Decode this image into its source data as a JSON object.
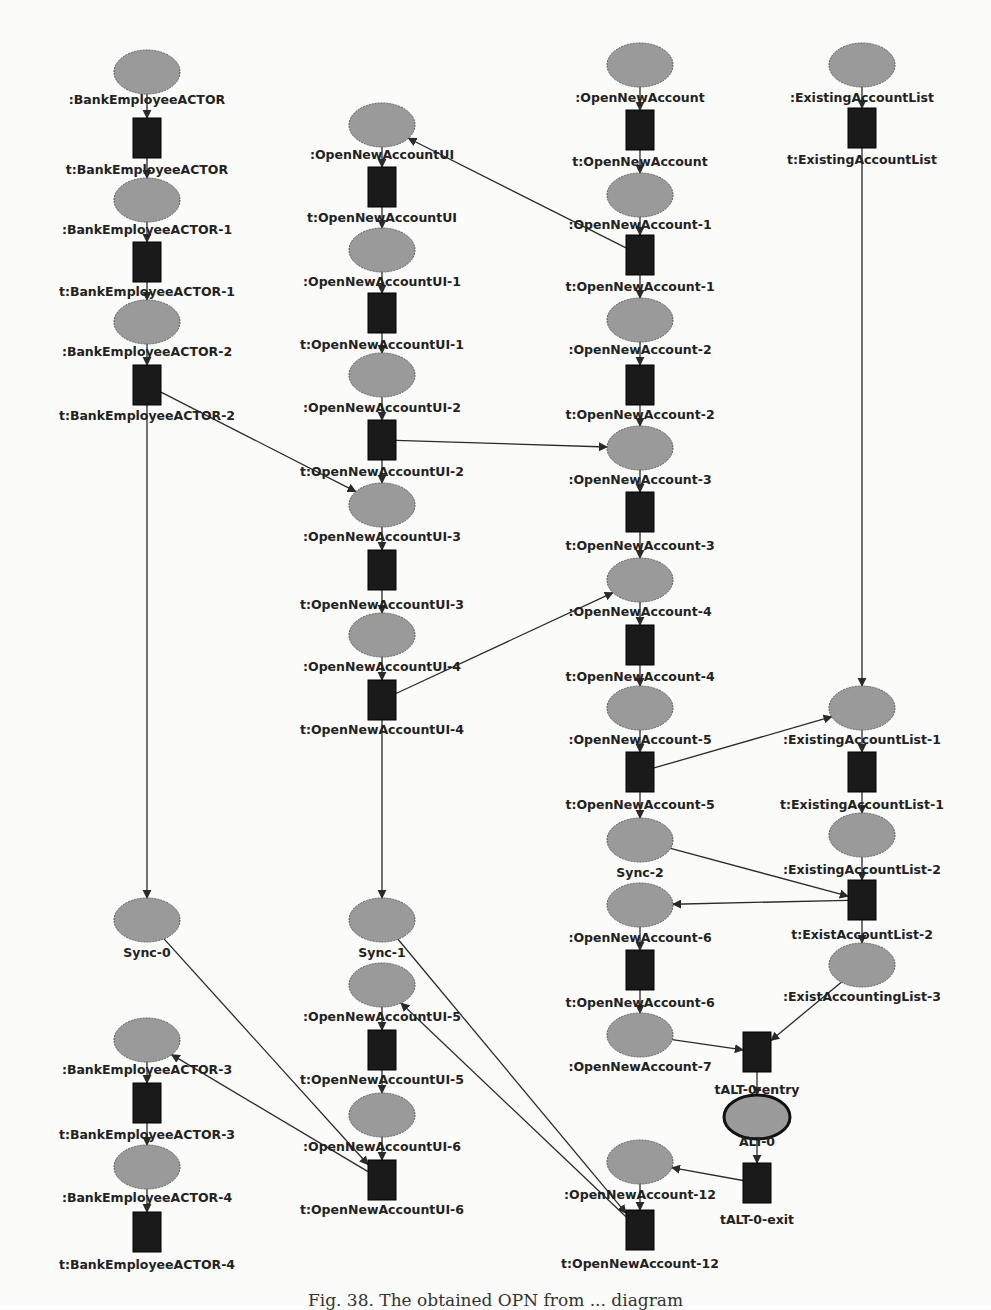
{
  "diagram": {
    "type": "petri-net",
    "colors": {
      "place_fill": "#9a9a9a",
      "place_stroke": "#555555",
      "transition_fill": "#1a1a1a",
      "arc": "#2a2a2a",
      "label": "#222222",
      "background": "#fbfbfa"
    },
    "places": [
      {
        "id": "p_bea",
        "label": ":BankEmployeeACTOR"
      },
      {
        "id": "p_bea1",
        "label": ":BankEmployeeACTOR-1"
      },
      {
        "id": "p_bea2",
        "label": ":BankEmployeeACTOR-2"
      },
      {
        "id": "p_sync0",
        "label": "Sync-0"
      },
      {
        "id": "p_bea3",
        "label": ":BankEmployeeACTOR-3"
      },
      {
        "id": "p_bea4",
        "label": ":BankEmployeeACTOR-4"
      },
      {
        "id": "p_ui",
        "label": ":OpenNewAccountUI"
      },
      {
        "id": "p_ui1",
        "label": ":OpenNewAccountUI-1"
      },
      {
        "id": "p_ui2",
        "label": ":OpenNewAccountUI-2"
      },
      {
        "id": "p_ui3",
        "label": ":OpenNewAccountUI-3"
      },
      {
        "id": "p_ui4",
        "label": ":OpenNewAccountUI-4"
      },
      {
        "id": "p_sync1",
        "label": "Sync-1"
      },
      {
        "id": "p_ui5",
        "label": ":OpenNewAccountUI-5"
      },
      {
        "id": "p_ui6",
        "label": ":OpenNewAccountUI-6"
      },
      {
        "id": "p_ona",
        "label": ":OpenNewAccount"
      },
      {
        "id": "p_ona1",
        "label": ":OpenNewAccount-1"
      },
      {
        "id": "p_ona2",
        "label": ":OpenNewAccount-2"
      },
      {
        "id": "p_ona3",
        "label": ":OpenNewAccount-3"
      },
      {
        "id": "p_ona4",
        "label": ":OpenNewAccount-4"
      },
      {
        "id": "p_ona5",
        "label": ":OpenNewAccount-5"
      },
      {
        "id": "p_sync2",
        "label": "Sync-2"
      },
      {
        "id": "p_ona6",
        "label": ":OpenNewAccount-6"
      },
      {
        "id": "p_ona7",
        "label": ":OpenNewAccount-7"
      },
      {
        "id": "p_alt0",
        "label": "ALT-0",
        "emphasized": true
      },
      {
        "id": "p_ona12",
        "label": ":OpenNewAccount-12"
      },
      {
        "id": "p_eal",
        "label": ":ExistingAccountList"
      },
      {
        "id": "p_eal1",
        "label": ":ExistingAccountList-1"
      },
      {
        "id": "p_eal2",
        "label": ":ExistingAccountList-2"
      },
      {
        "id": "p_eal3",
        "label": ":ExistAccountingList-3"
      }
    ],
    "transitions": [
      {
        "id": "t_bea",
        "label": "t:BankEmployeeACTOR"
      },
      {
        "id": "t_bea1",
        "label": "t:BankEmployeeACTOR-1"
      },
      {
        "id": "t_bea2",
        "label": "t:BankEmployeeACTOR-2"
      },
      {
        "id": "t_bea3",
        "label": "t:BankEmployeeACTOR-3"
      },
      {
        "id": "t_bea4",
        "label": "t:BankEmployeeACTOR-4"
      },
      {
        "id": "t_ui",
        "label": "t:OpenNewAccountUI"
      },
      {
        "id": "t_ui1",
        "label": "t:OpenNewAccountUI-1"
      },
      {
        "id": "t_ui2",
        "label": "t:OpenNewAccountUI-2"
      },
      {
        "id": "t_ui3",
        "label": "t:OpenNewAccountUI-3"
      },
      {
        "id": "t_ui4",
        "label": "t:OpenNewAccountUI-4"
      },
      {
        "id": "t_ui5",
        "label": "t:OpenNewAccountUI-5"
      },
      {
        "id": "t_ui6",
        "label": "t:OpenNewAccountUI-6"
      },
      {
        "id": "t_ona",
        "label": "t:OpenNewAccount"
      },
      {
        "id": "t_ona1",
        "label": "t:OpenNewAccount-1"
      },
      {
        "id": "t_ona2",
        "label": "t:OpenNewAccount-2"
      },
      {
        "id": "t_ona3",
        "label": "t:OpenNewAccount-3"
      },
      {
        "id": "t_ona4",
        "label": "t:OpenNewAccount-4"
      },
      {
        "id": "t_ona5",
        "label": "t:OpenNewAccount-5"
      },
      {
        "id": "t_ona6",
        "label": "t:OpenNewAccount-6"
      },
      {
        "id": "t_alt_entry",
        "label": "tALT-0-entry"
      },
      {
        "id": "t_alt_exit",
        "label": "tALT-0-exit"
      },
      {
        "id": "t_ona12",
        "label": "t:OpenNewAccount-12"
      },
      {
        "id": "t_eal",
        "label": "t:ExistingAccountList"
      },
      {
        "id": "t_eal1",
        "label": "t:ExistingAccountList-1"
      },
      {
        "id": "t_eal2",
        "label": "t:ExistAccountList-2"
      }
    ],
    "arcs": [
      [
        "p_bea",
        "t_bea"
      ],
      [
        "t_bea",
        "p_bea1"
      ],
      [
        "p_bea1",
        "t_bea1"
      ],
      [
        "t_bea1",
        "p_bea2"
      ],
      [
        "p_bea2",
        "t_bea2"
      ],
      [
        "t_bea2",
        "p_sync0"
      ],
      [
        "t_bea2",
        "p_ui3"
      ],
      [
        "p_sync0",
        "t_ui6"
      ],
      [
        "t_ui6",
        "p_bea3"
      ],
      [
        "p_bea3",
        "t_bea3"
      ],
      [
        "t_bea3",
        "p_bea4"
      ],
      [
        "p_bea4",
        "t_bea4"
      ],
      [
        "p_ui",
        "t_ui"
      ],
      [
        "t_ui",
        "p_ui1"
      ],
      [
        "p_ui1",
        "t_ui1"
      ],
      [
        "t_ui1",
        "p_ui2"
      ],
      [
        "p_ui2",
        "t_ui2"
      ],
      [
        "t_ui2",
        "p_ui3"
      ],
      [
        "t_ui2",
        "p_ona3"
      ],
      [
        "p_ui3",
        "t_ui3"
      ],
      [
        "t_ui3",
        "p_ui4"
      ],
      [
        "p_ui4",
        "t_ui4"
      ],
      [
        "t_ui4",
        "p_sync1"
      ],
      [
        "t_ui4",
        "p_ona4"
      ],
      [
        "p_sync1",
        "t_ona12"
      ],
      [
        "t_ona12",
        "p_ui5"
      ],
      [
        "p_ui5",
        "t_ui5"
      ],
      [
        "t_ui5",
        "p_ui6"
      ],
      [
        "p_ui6",
        "t_ui6"
      ],
      [
        "p_ona",
        "t_ona"
      ],
      [
        "t_ona",
        "p_ona1"
      ],
      [
        "p_ona1",
        "t_ona1"
      ],
      [
        "t_ona1",
        "p_ui"
      ],
      [
        "t_ona1",
        "p_ona2"
      ],
      [
        "p_ona2",
        "t_ona2"
      ],
      [
        "t_ona2",
        "p_ona3"
      ],
      [
        "p_ona3",
        "t_ona3"
      ],
      [
        "t_ona3",
        "p_ona4"
      ],
      [
        "p_ona4",
        "t_ona4"
      ],
      [
        "t_ona4",
        "p_ona5"
      ],
      [
        "p_ona5",
        "t_ona5"
      ],
      [
        "t_ona5",
        "p_sync2"
      ],
      [
        "t_ona5",
        "p_eal1"
      ],
      [
        "p_sync2",
        "t_eal2"
      ],
      [
        "t_eal2",
        "p_ona6"
      ],
      [
        "p_ona6",
        "t_ona6"
      ],
      [
        "t_ona6",
        "p_ona7"
      ],
      [
        "p_ona7",
        "t_alt_entry"
      ],
      [
        "t_alt_entry",
        "p_alt0"
      ],
      [
        "p_alt0",
        "t_alt_exit"
      ],
      [
        "t_alt_exit",
        "p_ona12"
      ],
      [
        "p_ona12",
        "t_ona12"
      ],
      [
        "p_eal",
        "t_eal"
      ],
      [
        "t_eal",
        "p_eal1"
      ],
      [
        "p_eal1",
        "t_eal1"
      ],
      [
        "t_eal1",
        "p_eal2"
      ],
      [
        "p_eal2",
        "t_eal2"
      ],
      [
        "t_eal2",
        "p_eal3"
      ],
      [
        "p_eal3",
        "t_alt_entry"
      ]
    ]
  },
  "caption": "Fig. 38.  The obtained OPN from ...  diagram"
}
